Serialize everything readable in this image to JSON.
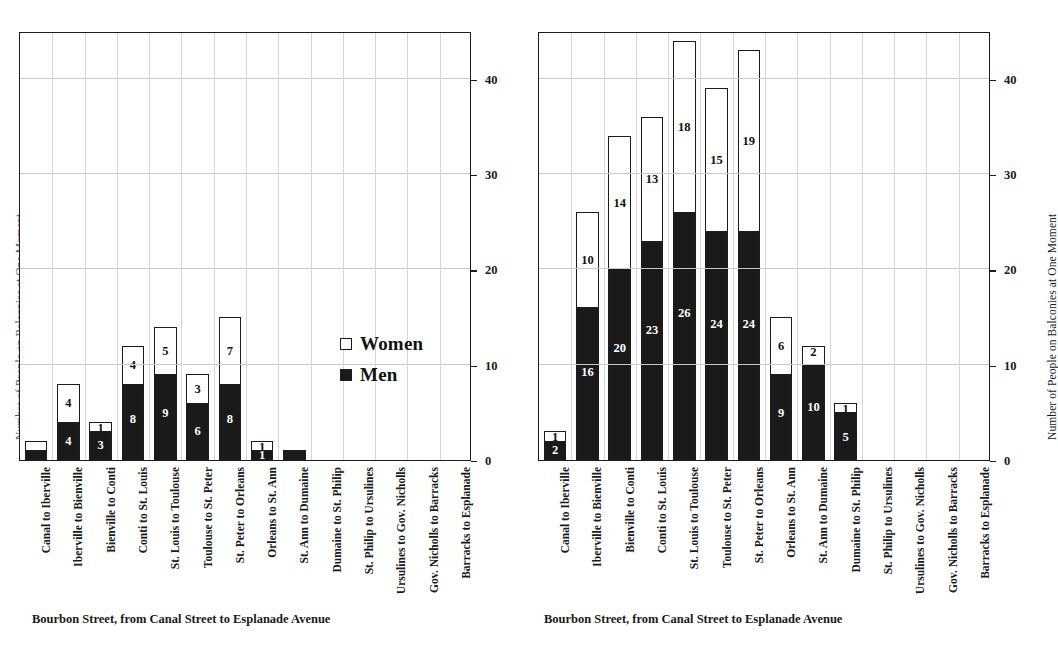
{
  "chart_data": [
    {
      "id": "left",
      "type": "bar",
      "subtype": "stacked",
      "title": "",
      "xlabel": "Bourbon Street, from Canal Street to Esplanade Avenue",
      "ylabel": "Number of People on Balconies at One Moment",
      "ylim": [
        0,
        45
      ],
      "yticks": [
        0,
        10,
        20,
        30,
        40
      ],
      "grid": true,
      "legend": [
        "Women",
        "Men"
      ],
      "legend_position": "inside-right-middle",
      "categories": [
        "Canal to Iberville",
        "Iberville to Bienville",
        "Bienville to Conti",
        "Conti to St. Louis",
        "St. Louis to Toulouse",
        "Toulouse to St. Peter",
        "St. Peter to Orleans",
        "Orleans to St. Ann",
        "St. Ann to Dumaine",
        "Dumaine to St. Philip",
        "St. Philip to Ursulines",
        "Ursulines to Gov. Nicholls",
        "Gov. Nicholls to Barracks",
        "Barracks to Esplanade"
      ],
      "series": [
        {
          "name": "Men",
          "values": [
            1,
            4,
            3,
            8,
            9,
            6,
            8,
            1,
            1,
            0,
            0,
            0,
            0,
            0
          ]
        },
        {
          "name": "Women",
          "values": [
            1,
            4,
            1,
            4,
            5,
            3,
            7,
            1,
            0,
            0,
            0,
            0,
            0,
            0
          ]
        }
      ],
      "men_labels": [
        "",
        "4",
        "3",
        "8",
        "9",
        "6",
        "8",
        "1",
        "",
        "",
        "",
        "",
        "",
        ""
      ],
      "women_labels": [
        "",
        "4",
        "1",
        "4",
        "5",
        "3",
        "7",
        "1",
        "",
        "",
        "",
        "",
        "",
        ""
      ]
    },
    {
      "id": "right",
      "type": "bar",
      "subtype": "stacked",
      "title": "",
      "xlabel": "Bourbon Street, from Canal Street to Esplanade Avenue",
      "ylabel": "Number of People on Balconies at One Moment",
      "ylim": [
        0,
        45
      ],
      "yticks": [
        0,
        10,
        20,
        30,
        40
      ],
      "grid": true,
      "legend": [
        "Women",
        "Men"
      ],
      "legend_position": "none",
      "categories": [
        "Canal to Iberville",
        "Iberville to Bienville",
        "Bienville to Conti",
        "Conti to St. Louis",
        "St. Louis to Toulouse",
        "Toulouse to St. Peter",
        "St. Peter to Orleans",
        "Orleans to St. Ann",
        "St. Ann to Dumaine",
        "Dumaine to St. Philip",
        "St. Philip to Ursulines",
        "Ursulines to Gov. Nicholls",
        "Gov. Nicholls to Barracks",
        "Barracks to Esplanade"
      ],
      "series": [
        {
          "name": "Men",
          "values": [
            2,
            16,
            20,
            23,
            26,
            24,
            24,
            9,
            10,
            5,
            0,
            0,
            0,
            0
          ]
        },
        {
          "name": "Women",
          "values": [
            1,
            10,
            14,
            13,
            18,
            15,
            19,
            6,
            2,
            1,
            0,
            0,
            0,
            0
          ]
        }
      ],
      "men_labels": [
        "2",
        "16",
        "20",
        "23",
        "26",
        "24",
        "24",
        "9",
        "10",
        "5",
        "",
        "",
        "",
        ""
      ],
      "women_labels": [
        "1",
        "10",
        "14",
        "13",
        "18",
        "15",
        "19",
        "6",
        "2",
        "1",
        "",
        "",
        "",
        ""
      ]
    }
  ],
  "legend": {
    "women_label": "Women",
    "men_label": "Men"
  },
  "colors": {
    "men_fill": "#1a1a1a",
    "women_fill": "#ffffff",
    "stroke": "#1c1c1c",
    "grid": "#c9c9c9",
    "text": "#1a1a1a"
  }
}
